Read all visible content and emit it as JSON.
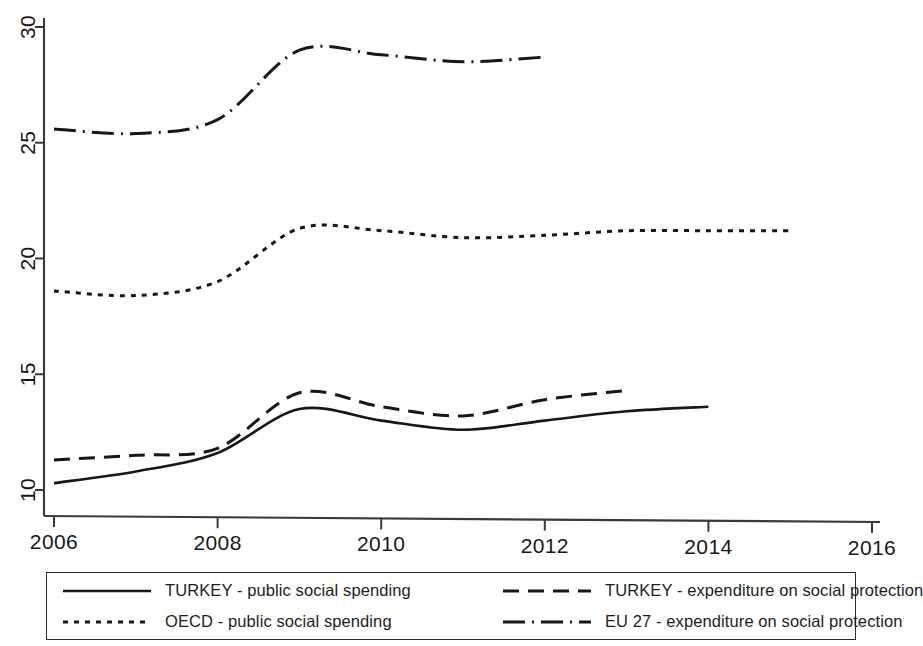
{
  "chart_data": {
    "type": "line",
    "title": "",
    "subtitle": "",
    "xlabel": "",
    "ylabel": "",
    "xlim": [
      2006,
      2016
    ],
    "ylim": [
      10,
      30
    ],
    "x_ticks": [
      2006,
      2008,
      2010,
      2012,
      2014,
      2016
    ],
    "x_tick_labels": [
      "2006",
      "2008",
      "2010",
      "2012",
      "2014",
      "2016"
    ],
    "y_ticks": [
      10,
      15,
      20,
      25,
      30
    ],
    "y_tick_labels": [
      "10",
      "15",
      "20",
      "25",
      "30"
    ],
    "grid": false,
    "legend_position": "bottom",
    "series": [
      {
        "name": "TURKEY - public social spending",
        "style": "solid",
        "x": [
          2006,
          2007,
          2008,
          2009,
          2010,
          2011,
          2012,
          2013,
          2014
        ],
        "values": [
          10.3,
          10.8,
          11.6,
          13.5,
          13.0,
          12.6,
          13.0,
          13.4,
          13.6
        ]
      },
      {
        "name": "TURKEY - expenditure on social protection",
        "style": "dashed",
        "x": [
          2006,
          2007,
          2008,
          2009,
          2010,
          2011,
          2012,
          2013
        ],
        "values": [
          11.3,
          11.5,
          11.8,
          14.2,
          13.6,
          13.2,
          13.9,
          14.3
        ]
      },
      {
        "name": "OECD - public social spending",
        "style": "dotted",
        "x": [
          2006,
          2007,
          2008,
          2009,
          2010,
          2011,
          2012,
          2013,
          2014,
          2015
        ],
        "values": [
          18.6,
          18.4,
          19.0,
          21.3,
          21.2,
          20.9,
          21.0,
          21.2,
          21.2,
          21.2
        ]
      },
      {
        "name": "EU 27 - expenditure on social protection",
        "style": "dashdot",
        "x": [
          2006,
          2007,
          2008,
          2009,
          2010,
          2011,
          2012
        ],
        "values": [
          25.6,
          25.4,
          26.0,
          29.0,
          28.8,
          28.5,
          28.7
        ]
      }
    ]
  },
  "legend": {
    "entries": [
      {
        "label": "TURKEY - public social spending",
        "style": "solid"
      },
      {
        "label": "TURKEY - expenditure on social protection",
        "style": "dashed"
      },
      {
        "label": "OECD - public social spending",
        "style": "dotted"
      },
      {
        "label": "EU 27 - expenditure on social protection",
        "style": "dashdot"
      }
    ]
  }
}
